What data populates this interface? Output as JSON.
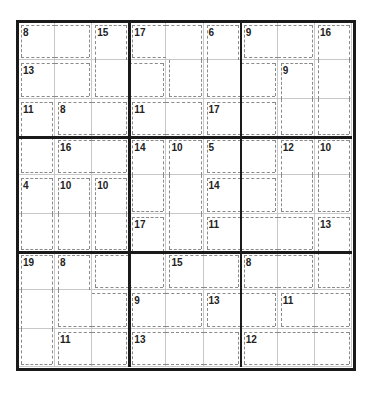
{
  "puzzle": {
    "type": "killer-sudoku",
    "size": 9,
    "cage_map": [
      [
        "A",
        "A",
        "B",
        "C",
        "C",
        "D",
        "E",
        "E",
        "F"
      ],
      [
        "G",
        "G",
        "B",
        "B",
        "C",
        "D",
        "D",
        "H",
        "F"
      ],
      [
        "I",
        "J",
        "J",
        "K",
        "K",
        "L",
        "L",
        "H",
        "F"
      ],
      [
        "I",
        "M",
        "M",
        "N",
        "O",
        "P",
        "P",
        "Q",
        "R"
      ],
      [
        "S",
        "T",
        "U",
        "N",
        "O",
        "V",
        "V",
        "Q",
        "R"
      ],
      [
        "S",
        "T",
        "U",
        "W",
        "O",
        "X",
        "X",
        "X",
        "Y"
      ],
      [
        "Z",
        "a",
        "W",
        "W",
        "b",
        "b",
        "c",
        "c",
        "Y"
      ],
      [
        "Z",
        "a",
        "a",
        "d",
        "d",
        "e",
        "e",
        "f",
        "f"
      ],
      [
        "Z",
        "g",
        "g",
        "h",
        "h",
        "h",
        "i",
        "i",
        "i"
      ]
    ],
    "cage_sums": {
      "A": "8",
      "B": "15",
      "C": "17",
      "D": "6",
      "E": "9",
      "F": "16",
      "G": "13",
      "H": "9",
      "I": "11",
      "J": "8",
      "K": "11",
      "L": "17",
      "M": "16",
      "N": "14",
      "O": "10",
      "P": "5",
      "Q": "12",
      "R": "10",
      "S": "4",
      "T": "10",
      "U": "10",
      "V": "14",
      "W": "17",
      "X": "11",
      "Y": "13",
      "Z": "19",
      "a": "8",
      "b": "15",
      "c": "8",
      "d": "9",
      "e": "13",
      "f": "11",
      "g": "11",
      "h": "13",
      "i": "12"
    },
    "cell_values": [
      [
        "",
        "",
        "",
        "",
        "",
        "",
        "",
        "",
        ""
      ],
      [
        "",
        "",
        "",
        "",
        "",
        "",
        "",
        "",
        ""
      ],
      [
        "",
        "",
        "",
        "",
        "",
        "",
        "",
        "",
        ""
      ],
      [
        "",
        "",
        "",
        "",
        "",
        "",
        "",
        "",
        ""
      ],
      [
        "",
        "",
        "",
        "",
        "",
        "",
        "",
        "",
        ""
      ],
      [
        "",
        "",
        "",
        "",
        "",
        "",
        "",
        "",
        ""
      ],
      [
        "",
        "",
        "",
        "",
        "",
        "",
        "",
        "",
        ""
      ],
      [
        "",
        "",
        "",
        "",
        "",
        "",
        "",
        "",
        ""
      ],
      [
        "",
        "",
        "",
        "",
        "",
        "",
        "",
        "",
        ""
      ]
    ]
  }
}
